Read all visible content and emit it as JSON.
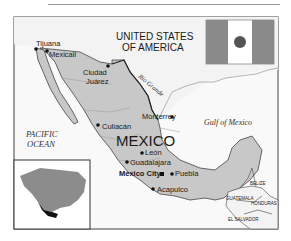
{
  "map": {
    "title": "MEXICO",
    "neighbors": {
      "usa_line1": "UNITED STATES",
      "usa_line2": "OF AMERICA",
      "belize": "BELIZE",
      "guatemala": "GUATEMALA",
      "honduras": "HONDURAS",
      "el_salvador": "EL SALVADOR"
    },
    "water": {
      "pacific_line1": "PACIFIC",
      "pacific_line2": "OCEAN",
      "gulf": "Gulf of Mexico",
      "river": "Rio Grande"
    },
    "cities": [
      {
        "name": "Tijuana",
        "x": 36,
        "y": 35
      },
      {
        "name": "Mexicali",
        "x": 48,
        "y": 51
      },
      {
        "name": "Ciudad",
        "x": 110,
        "y": 72
      },
      {
        "name": "Juárez",
        "x": 110,
        "y": 83
      },
      {
        "name": "Monterrey",
        "x": 145,
        "y": 116
      },
      {
        "name": "Culiacán",
        "x": 104,
        "y": 128
      },
      {
        "name": "León",
        "x": 146,
        "y": 153
      },
      {
        "name": "Guadalajara",
        "x": 131,
        "y": 164
      },
      {
        "name": "Mexico City",
        "x": 120,
        "y": 175
      },
      {
        "name": "Puebla",
        "x": 175,
        "y": 175
      },
      {
        "name": "Acapulco",
        "x": 156,
        "y": 190
      }
    ],
    "capital": "Mexico City",
    "colors": {
      "land_mexico": "#c8c8c8",
      "land_other": "#f2f2f2",
      "water": "#fafafa",
      "border": "#333333",
      "flag_side": "#8a8a8a",
      "flag_center": "#ffffff",
      "inset_continent": "#8c8c8c",
      "inset_mexico": "#111111"
    }
  }
}
